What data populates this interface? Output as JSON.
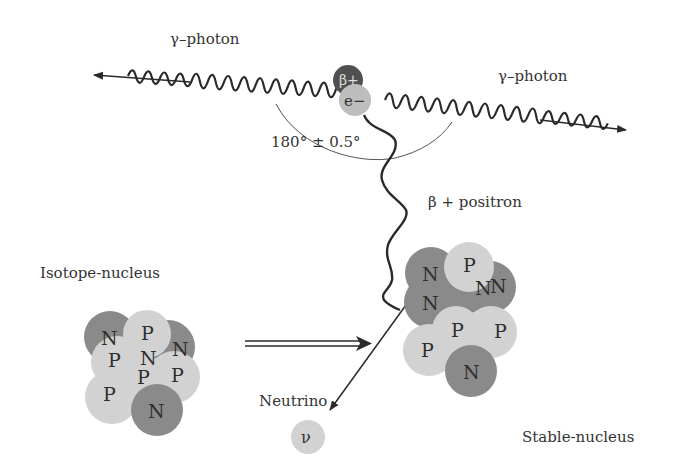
{
  "diagram": {
    "labels": {
      "photon_left": "γ–photon",
      "photon_right": "γ–photon",
      "angle": "180° ± 0.5°",
      "positron": "β + positron",
      "isotope": "Isotope-nucleus",
      "neutrino": "Neutrino",
      "stable": "Stable-nucleus"
    },
    "particles": {
      "beta_plus": "β+",
      "electron": "e−",
      "neutrino_symbol": "ν"
    },
    "isotope_nucleus": [
      {
        "type": "N",
        "label": "N"
      },
      {
        "type": "P",
        "label": "P"
      },
      {
        "type": "N",
        "label": "N"
      },
      {
        "type": "N",
        "label": "N"
      },
      {
        "type": "P",
        "label": "P"
      },
      {
        "type": "P",
        "label": "P"
      },
      {
        "type": "P",
        "label": "P"
      },
      {
        "type": "P",
        "label": "P"
      },
      {
        "type": "N",
        "label": "N"
      }
    ],
    "stable_nucleus": [
      {
        "type": "N",
        "label": "N"
      },
      {
        "type": "P",
        "label": "P"
      },
      {
        "type": "N",
        "label": "N"
      },
      {
        "type": "N",
        "label": "N"
      },
      {
        "type": "N",
        "label": "N"
      },
      {
        "type": "P",
        "label": "P"
      },
      {
        "type": "P",
        "label": "P"
      },
      {
        "type": "P",
        "label": "P"
      },
      {
        "type": "N",
        "label": "N"
      }
    ],
    "colors": {
      "neutron": "#8a8a8a",
      "proton": "#d2d2d2",
      "beta_plus": "#505050",
      "electron": "#bdbdbd",
      "line": "#2a2a2a"
    }
  }
}
